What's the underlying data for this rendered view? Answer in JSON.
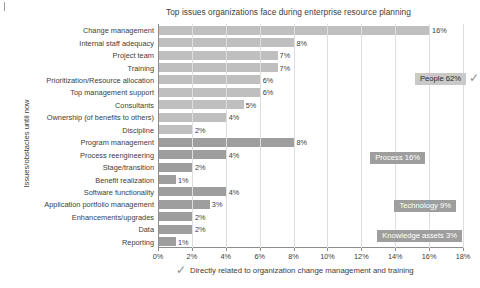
{
  "chart_data": {
    "type": "bar",
    "orientation": "horizontal",
    "title": "Top issues organizations face during enterprise resource planning",
    "xlabel": "",
    "ylabel": "Issues/obstacles until now",
    "xlim": [
      0,
      18
    ],
    "xticks": [
      "0%",
      "2%",
      "4%",
      "6%",
      "8%",
      "10%",
      "12%",
      "14%",
      "16%",
      "18%"
    ],
    "xtick_values": [
      0,
      2,
      4,
      6,
      8,
      10,
      12,
      14,
      16,
      18
    ],
    "grid": true,
    "legend": "none",
    "categories": [
      "Change management",
      "Internal staff adequacy",
      "Project team",
      "Training",
      "Prioritization/Resource allocation",
      "Top management support",
      "Consultants",
      "Ownership (of benefits to others)",
      "Discipline",
      "Program management",
      "Process reengineering",
      "Stage/transition",
      "Benefit realization",
      "Software functionality",
      "Application portfolio management",
      "Enhancements/upgrades",
      "Data",
      "Reporting"
    ],
    "values": [
      16,
      8,
      7,
      7,
      6,
      6,
      5,
      4,
      2,
      8,
      4,
      2,
      1,
      4,
      3,
      2,
      2,
      1
    ],
    "value_labels": [
      "16%",
      "8%",
      "7%",
      "7%",
      "6%",
      "6%",
      "5%",
      "4%",
      "2%",
      "8%",
      "4%",
      "2%",
      "1%",
      "4%",
      "3%",
      "2%",
      "2%",
      "1%"
    ],
    "groups": [
      {
        "name": "People",
        "total": "62%",
        "label": "People 62%",
        "style": "light",
        "categories": 9,
        "checkmark": true
      },
      {
        "name": "Process",
        "total": "16%",
        "label": "Process 16%",
        "style": "dark",
        "categories": 4,
        "checkmark": false
      },
      {
        "name": "Technology",
        "total": "9%",
        "label": "Technology 9%",
        "style": "dark",
        "categories": 3,
        "checkmark": false
      },
      {
        "name": "Knowledge assets",
        "total": "3%",
        "label": "Knowledge assets 3%",
        "style": "dark",
        "categories": 2,
        "checkmark": false
      }
    ],
    "annotations": [
      {
        "text": "Directly related to organization change management and training",
        "icon": "checkmark"
      }
    ],
    "colors": {
      "people_bar": "#bfbfbf",
      "other_bar": "#9e9e9e",
      "people_label_bg": "#c9c9c9",
      "group_label_bg": "#9e9e9e",
      "group_label_text": "#ffffff",
      "axis": "#8d8d8d",
      "grid": "#dedede",
      "text": "#3d3d3d",
      "background": "#ffffff"
    }
  },
  "footnote": {
    "text": "Directly related to organization change management and training",
    "icon": "checkmark-icon"
  }
}
